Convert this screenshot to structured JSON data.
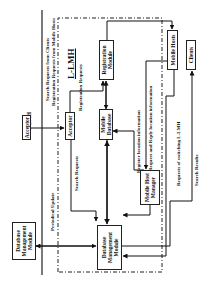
{
  "diagram": {
    "orientation": "rotated-90-ccw",
    "regions": {
      "outer_label": "U-LMH",
      "inner_label": "L-LMH"
    },
    "nodes": {
      "acceptor_outer": "Acceptor",
      "acceptor_inner": "Acceptor",
      "registration_module": "Registration Module",
      "mobile_database": "Mobile Database",
      "mobile_hosts": "Mobile Hosts",
      "clients": "Clients",
      "mobile_host_manager": "Mobile Host Manager",
      "dbm_outer": "Database Management Module",
      "dbm_inner": "Database Management Module"
    },
    "edge_labels": {
      "search_requests_from_clients": "Search Requests from Clients",
      "registration_requests_from_mobile_hosts": "Registration Requests from Mobile Hosts",
      "registration_requests": "Registration Requests",
      "search_requests": "Search Requests",
      "periodical_update": "Periodical Update",
      "register_location_information": "Register location information",
      "request_and_reply_location_information": "Request and Reply location information",
      "requests_of_switching": "Requests of switching L-LMH",
      "search_results": "Search Results"
    }
  }
}
